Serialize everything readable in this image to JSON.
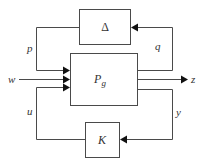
{
  "diagram": {
    "type": "block-diagram",
    "blocks": [
      {
        "id": "delta",
        "label": "Δ"
      },
      {
        "id": "plant",
        "label": "P",
        "subscript": "g"
      },
      {
        "id": "controller",
        "label": "K"
      }
    ],
    "signals": [
      {
        "id": "p",
        "label": "p",
        "from": "delta",
        "to": "plant"
      },
      {
        "id": "q",
        "label": "q",
        "from": "plant",
        "to": "delta"
      },
      {
        "id": "w",
        "label": "w",
        "from": "external",
        "to": "plant"
      },
      {
        "id": "z",
        "label": "z",
        "from": "plant",
        "to": "external"
      },
      {
        "id": "u",
        "label": "u",
        "from": "controller",
        "to": "plant"
      },
      {
        "id": "y",
        "label": "y",
        "from": "plant",
        "to": "controller"
      }
    ],
    "colors": {
      "line": "#4a4a4a",
      "arrow": "#111111",
      "text": "#333333",
      "background": "#ffffff"
    }
  }
}
